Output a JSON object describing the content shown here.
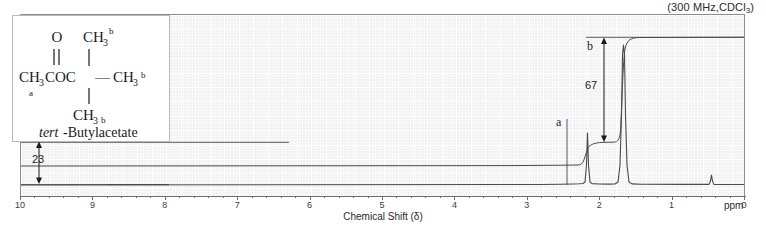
{
  "header": {
    "conditions_prefix": "(300 MHz,CDCl",
    "conditions_sub": "3",
    "conditions_suffix": ")",
    "conditions_full": "(300 MHz,CDCl3)"
  },
  "structure": {
    "name_italic": "tert",
    "name_rest": "-Butylacetate",
    "atom_o": "O",
    "atom_ch3_top": "CH",
    "atom_ch3_top_sub": "3",
    "atom_ch3_top_sup": "b",
    "chain": "CH",
    "chain_sub": "3",
    "chain_rest": "COC",
    "label_a": "a",
    "right_ch3": "CH",
    "right_ch3_sub": "3",
    "right_ch3_sup": "b",
    "bottom_ch3": "CH",
    "bottom_ch3_sub": "3",
    "bottom_ch3_sup": "b",
    "bond_dash": "—"
  },
  "annotations": {
    "peak_a_label": "a",
    "peak_b_label": "b",
    "integration_a": "23",
    "integration_b": "67"
  },
  "axis": {
    "title": "Chemical Shift (δ)",
    "unit": "ppm",
    "ticks": [
      "10",
      "9",
      "8",
      "7",
      "6",
      "5",
      "4",
      "3",
      "2",
      "1",
      "0"
    ],
    "min": 0,
    "max": 10
  },
  "colors": {
    "plot_background": "#f2f2f2",
    "grid": "#ffffff",
    "trace": "#4a4a4a",
    "frame": "#8d8d8d",
    "text": "#1a1a1a"
  },
  "chart_data": {
    "type": "line",
    "xlabel": "Chemical Shift (δ)",
    "ylabel": "",
    "xlim": [
      10,
      0
    ],
    "grid": true,
    "legend": null,
    "peaks": [
      {
        "label": "a",
        "shift_ppm": 1.95,
        "assignment": "CH3 (acetyl)",
        "integration": 23,
        "protons": 3,
        "relative_height": 0.33
      },
      {
        "label": "b",
        "shift_ppm": 1.45,
        "assignment": "C(CH3)3 (tert-butyl)",
        "integration": 67,
        "protons": 9,
        "relative_height": 0.95
      },
      {
        "label": "TMS",
        "shift_ppm": 0.0,
        "assignment": "TMS reference",
        "integration": 0,
        "protons": 0,
        "relative_height": 0.09
      }
    ],
    "integration_steps": [
      {
        "label": "a",
        "value": 23,
        "from_ppm": 2.2,
        "to_ppm": 1.8
      },
      {
        "label": "b",
        "value": 67,
        "from_ppm": 1.7,
        "to_ppm": 1.2
      }
    ]
  }
}
